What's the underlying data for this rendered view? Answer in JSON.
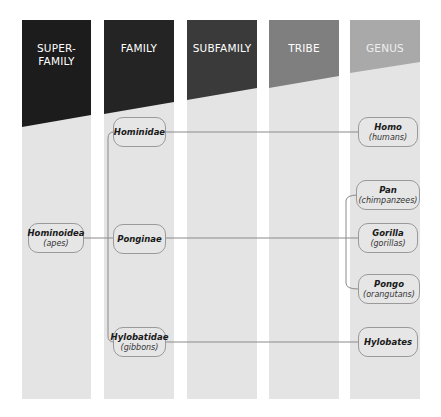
{
  "diagram": {
    "type": "taxonomy-tree",
    "columns": [
      {
        "id": "superfamily",
        "label_line1": "SUPER-",
        "label_line2": "FAMILY",
        "color": "#1c1c1c"
      },
      {
        "id": "family",
        "label_line1": "FAMILY",
        "label_line2": "",
        "color": "#242424"
      },
      {
        "id": "subfamily",
        "label_line1": "SUBFAMILY",
        "label_line2": "",
        "color": "#3a3a3a"
      },
      {
        "id": "tribe",
        "label_line1": "TRIBE",
        "label_line2": "",
        "color": "#7f7f7f"
      },
      {
        "id": "genus",
        "label_line1": "GENUS",
        "label_line2": "",
        "color": "#a9a9a9"
      }
    ],
    "nodes": {
      "hominoidea": {
        "name": "Hominoidea",
        "common": "(apes)",
        "column": "superfamily"
      },
      "hominidae": {
        "name": "Hominidae",
        "common": "",
        "column": "family"
      },
      "ponginae": {
        "name": "Ponginae",
        "common": "",
        "column": "family"
      },
      "hylobatidae": {
        "name": "Hylobatidae",
        "common": "(gibbons)",
        "column": "family"
      },
      "homo": {
        "name": "Homo",
        "common": "(humans)",
        "column": "genus"
      },
      "pan": {
        "name": "Pan",
        "common": "(chimpanzees)",
        "column": "genus"
      },
      "gorilla": {
        "name": "Gorilla",
        "common": "(gorillas)",
        "column": "genus"
      },
      "pongo": {
        "name": "Pongo",
        "common": "(orangutans)",
        "column": "genus"
      },
      "hylobates": {
        "name": "Hylobates",
        "common": "",
        "column": "genus"
      }
    },
    "edges": [
      [
        "hominoidea",
        "hominidae"
      ],
      [
        "hominoidea",
        "ponginae"
      ],
      [
        "hominoidea",
        "hylobatidae"
      ],
      [
        "hominidae",
        "homo"
      ],
      [
        "ponginae",
        "pan"
      ],
      [
        "ponginae",
        "gorilla"
      ],
      [
        "ponginae",
        "pongo"
      ],
      [
        "hylobatidae",
        "hylobates"
      ]
    ],
    "colors": {
      "column_body": "#e4e4e4",
      "node_fill": "#e6e6e6",
      "node_border": "#9a9a9a",
      "line": "#8a8a8a"
    }
  }
}
